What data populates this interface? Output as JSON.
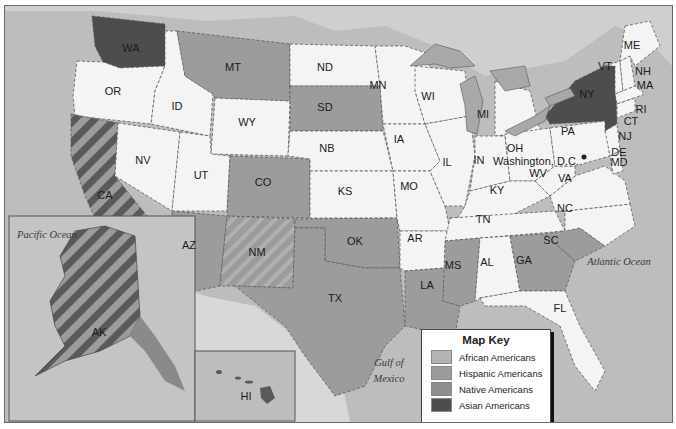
{
  "map": {
    "title": "Where Minority Groups Make Up a Large Share of the Population",
    "colors": {
      "ocean": "#bdbdbd",
      "land_none": "#f4f4f4",
      "african_americans": "#b3b3b3",
      "hispanic_americans": "#9c9c9c",
      "native_americans": "#8d8d8d",
      "asian_americans": "#4d4d4d",
      "lakes": "#a8a8a8",
      "foreign": "#d6d6d6"
    },
    "legend": {
      "title": "Map Key",
      "items": [
        {
          "label": "African Americans",
          "color": "#b3b3b3"
        },
        {
          "label": "Hispanic Americans",
          "color": "#9c9c9c"
        },
        {
          "label": "Native Americans",
          "color": "#8d8d8d"
        },
        {
          "label": "Asian Americans",
          "color": "#4d4d4d"
        }
      ]
    },
    "water_labels": {
      "pacific": "Pacific Ocean",
      "atlantic": "Atlantic Ocean",
      "gulf_line1": "Gulf of",
      "gulf_line2": "Mexico"
    },
    "capital_label": "Washington, D.C.",
    "states": {
      "WA": "WA",
      "OR": "OR",
      "CA": "CA",
      "ID": "ID",
      "NV": "NV",
      "MT": "MT",
      "WY": "WY",
      "UT": "UT",
      "AZ": "AZ",
      "CO": "CO",
      "NM": "NM",
      "ND": "ND",
      "SD": "SD",
      "NB": "NB",
      "KS": "KS",
      "OK": "OK",
      "TX": "TX",
      "MN": "MN",
      "IA": "IA",
      "MO": "MO",
      "AR": "AR",
      "LA": "LA",
      "WI": "WI",
      "IL": "IL",
      "MI": "MI",
      "IN": "IN",
      "OH": "OH",
      "KY": "KY",
      "TN": "TN",
      "MS": "MS",
      "AL": "AL",
      "GA": "GA",
      "FL": "FL",
      "SC": "SC",
      "NC": "NC",
      "VA": "VA",
      "WV": "WV",
      "PA": "PA",
      "NY": "NY",
      "VT": "VT",
      "NH": "NH",
      "ME": "ME",
      "MA": "MA",
      "RI": "RI",
      "CT": "CT",
      "NJ": "NJ",
      "DE": "DE",
      "MD": "MD",
      "AK": "AK",
      "HI": "HI"
    }
  }
}
